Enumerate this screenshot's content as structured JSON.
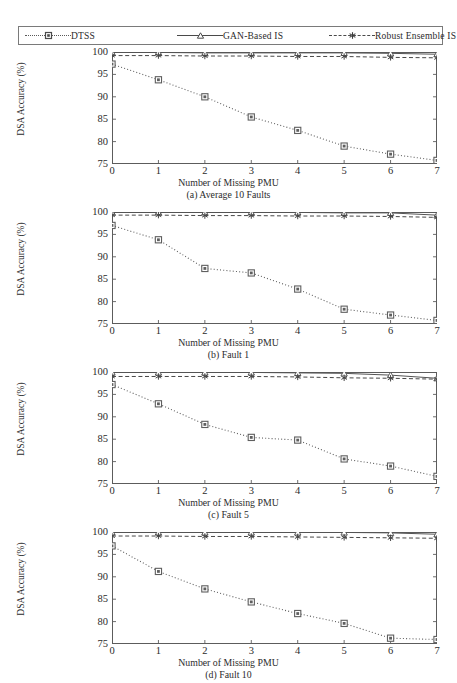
{
  "legend": {
    "entries": [
      {
        "label": "DTSS",
        "style": "dotted",
        "marker": "square-marker",
        "color": "#5a5a5a"
      },
      {
        "label": "GAN-Based IS",
        "style": "solid",
        "marker": "triangle-marker",
        "color": "#4a4a4a"
      },
      {
        "label": "Robust Ensemble IS",
        "style": "dashed",
        "marker": "asterisk-marker",
        "color": "#4a4a4a"
      }
    ]
  },
  "axes": {
    "xlabel": "Number of Missing PMU",
    "ylabel": "DSA Accuracy (%)",
    "xticks": [
      "0",
      "1",
      "2",
      "3",
      "4",
      "5",
      "6",
      "7"
    ],
    "yticks": [
      "75",
      "80",
      "85",
      "90",
      "95",
      "100"
    ]
  },
  "captions": {
    "a": "(a)  Average 10 Faults",
    "b": "(b)  Fault 1",
    "c": "(c)  Fault 5",
    "d": "(d)  Fault 10"
  },
  "footnote": "",
  "chart_data": [
    {
      "type": "line",
      "panel": "a",
      "title": "(a)  Average 10 Faults",
      "xlabel": "Number of Missing PMU",
      "ylabel": "DSA Accuracy (%)",
      "x": [
        0,
        1,
        2,
        3,
        4,
        5,
        6,
        7
      ],
      "xlim": [
        0,
        7
      ],
      "ylim": [
        75,
        100
      ],
      "grid": false,
      "legend_position": "top-outside",
      "series": [
        {
          "name": "DTSS",
          "values": [
            97.3,
            93.8,
            90.0,
            85.5,
            82.5,
            79.0,
            77.2,
            75.8
          ]
        },
        {
          "name": "GAN-Based IS",
          "values": [
            99.9,
            99.9,
            99.8,
            99.8,
            99.8,
            99.8,
            99.7,
            99.5
          ]
        },
        {
          "name": "Robust Ensemble IS",
          "values": [
            99.2,
            99.2,
            99.1,
            99.1,
            99.0,
            99.0,
            98.8,
            98.7
          ]
        }
      ]
    },
    {
      "type": "line",
      "panel": "b",
      "title": "(b)  Fault 1",
      "xlabel": "Number of Missing PMU",
      "ylabel": "DSA Accuracy (%)",
      "x": [
        0,
        1,
        2,
        3,
        4,
        5,
        6,
        7
      ],
      "xlim": [
        0,
        7
      ],
      "ylim": [
        75,
        100
      ],
      "grid": false,
      "legend_position": "top-outside",
      "series": [
        {
          "name": "DTSS",
          "values": [
            97.0,
            93.8,
            87.4,
            86.4,
            82.8,
            78.3,
            77.0,
            75.8
          ]
        },
        {
          "name": "GAN-Based IS",
          "values": [
            99.9,
            99.9,
            99.9,
            99.9,
            99.9,
            99.8,
            99.8,
            99.3
          ]
        },
        {
          "name": "Robust Ensemble IS",
          "values": [
            99.3,
            99.3,
            99.2,
            99.2,
            99.1,
            99.1,
            99.0,
            98.8
          ]
        }
      ]
    },
    {
      "type": "line",
      "panel": "c",
      "title": "(c)  Fault 5",
      "xlabel": "Number of Missing PMU",
      "ylabel": "DSA Accuracy (%)",
      "x": [
        0,
        1,
        2,
        3,
        4,
        5,
        6,
        7
      ],
      "xlim": [
        0,
        7
      ],
      "ylim": [
        75,
        100
      ],
      "grid": false,
      "legend_position": "top-outside",
      "series": [
        {
          "name": "DTSS",
          "values": [
            97.2,
            92.9,
            88.3,
            85.4,
            84.8,
            80.6,
            79.0,
            76.7
          ]
        },
        {
          "name": "GAN-Based IS",
          "values": [
            99.9,
            99.9,
            99.9,
            99.9,
            99.8,
            99.7,
            99.3,
            98.6
          ]
        },
        {
          "name": "Robust Ensemble IS",
          "values": [
            99.0,
            99.0,
            99.0,
            99.0,
            98.9,
            98.7,
            98.6,
            98.4
          ]
        }
      ]
    },
    {
      "type": "line",
      "panel": "d",
      "title": "(d)  Fault 10",
      "xlabel": "Number of Missing PMU",
      "ylabel": "DSA Accuracy (%)",
      "x": [
        0,
        1,
        2,
        3,
        4,
        5,
        6,
        7
      ],
      "xlim": [
        0,
        7
      ],
      "ylim": [
        75,
        100
      ],
      "grid": false,
      "legend_position": "top-outside",
      "series": [
        {
          "name": "DTSS",
          "values": [
            96.9,
            91.2,
            87.3,
            84.4,
            81.8,
            79.6,
            76.3,
            76.0
          ]
        },
        {
          "name": "GAN-Based IS",
          "values": [
            99.9,
            99.9,
            99.9,
            99.9,
            99.9,
            99.9,
            99.8,
            99.5
          ]
        },
        {
          "name": "Robust Ensemble IS",
          "values": [
            99.1,
            99.1,
            99.0,
            99.0,
            98.9,
            98.8,
            98.7,
            98.6
          ]
        }
      ]
    }
  ]
}
